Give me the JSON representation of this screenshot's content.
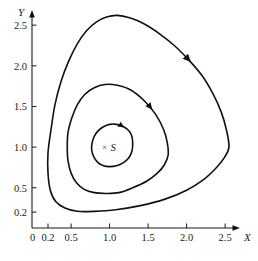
{
  "figure": {
    "kind": "phase-portrait",
    "background_color": "#ffffff",
    "curve_color": "#111111",
    "axis_color": "#1a1a1a"
  },
  "axes": {
    "x_name": "X",
    "y_name": "Y",
    "x_ticks": [
      "0",
      "0.2",
      "0.5",
      "1.0",
      "1.5",
      "2.0",
      "2.5"
    ],
    "x_tick_values": [
      0,
      0.2,
      0.5,
      1.0,
      1.5,
      2.0,
      2.5
    ],
    "y_ticks": [
      "0.2",
      "0.5",
      "1.0",
      "1.5",
      "2.0",
      "2.5"
    ],
    "y_tick_values": [
      0.2,
      0.5,
      1.0,
      1.5,
      2.0,
      2.5
    ],
    "x_range": [
      0,
      2.75
    ],
    "y_range": [
      0,
      2.75
    ],
    "grid": false
  },
  "annotations": {
    "fixed_point_marker": "×",
    "fixed_point_label": "S",
    "fixed_point_x": 1.0,
    "fixed_point_y": 1.0
  },
  "chart_data": {
    "type": "line",
    "title": "",
    "subtitle": "",
    "xlabel": "X",
    "ylabel": "Y",
    "xlim": [
      0,
      2.75
    ],
    "ylim": [
      0,
      2.75
    ],
    "grid": false,
    "legend": "none",
    "annotations": [
      {
        "text": "×S",
        "x": 1.0,
        "y": 1.0,
        "role": "fixed-point"
      }
    ],
    "series": [
      {
        "name": "orbit-inner",
        "closed": true,
        "direction": "counterclockwise",
        "x_min": 0.77,
        "x_max": 1.3,
        "y_min": 0.76,
        "y_max": 1.28,
        "arrow_at": {
          "x": 1.19,
          "y": 1.24
        },
        "points": [
          [
            1.3,
            1.04
          ],
          [
            1.29,
            1.13
          ],
          [
            1.25,
            1.2
          ],
          [
            1.18,
            1.25
          ],
          [
            1.09,
            1.28
          ],
          [
            1.0,
            1.28
          ],
          [
            0.92,
            1.25
          ],
          [
            0.85,
            1.2
          ],
          [
            0.8,
            1.13
          ],
          [
            0.77,
            1.04
          ],
          [
            0.77,
            0.95
          ],
          [
            0.8,
            0.87
          ],
          [
            0.85,
            0.81
          ],
          [
            0.92,
            0.77
          ],
          [
            1.0,
            0.76
          ],
          [
            1.09,
            0.77
          ],
          [
            1.18,
            0.81
          ],
          [
            1.25,
            0.87
          ],
          [
            1.29,
            0.95
          ],
          [
            1.3,
            1.04
          ]
        ]
      },
      {
        "name": "orbit-middle",
        "closed": true,
        "direction": "counterclockwise",
        "x_min": 0.45,
        "x_max": 1.76,
        "y_min": 0.43,
        "y_max": 1.77,
        "arrow_at": {
          "x": 1.58,
          "y": 1.48
        },
        "points": [
          [
            1.76,
            0.9
          ],
          [
            1.75,
            1.05
          ],
          [
            1.7,
            1.22
          ],
          [
            1.6,
            1.4
          ],
          [
            1.45,
            1.57
          ],
          [
            1.28,
            1.7
          ],
          [
            1.1,
            1.76
          ],
          [
            0.94,
            1.77
          ],
          [
            0.8,
            1.73
          ],
          [
            0.68,
            1.65
          ],
          [
            0.58,
            1.52
          ],
          [
            0.51,
            1.36
          ],
          [
            0.46,
            1.18
          ],
          [
            0.45,
            1.0
          ],
          [
            0.46,
            0.83
          ],
          [
            0.5,
            0.68
          ],
          [
            0.57,
            0.56
          ],
          [
            0.67,
            0.48
          ],
          [
            0.8,
            0.44
          ],
          [
            0.95,
            0.43
          ],
          [
            1.12,
            0.44
          ],
          [
            1.3,
            0.5
          ],
          [
            1.48,
            0.58
          ],
          [
            1.62,
            0.68
          ],
          [
            1.71,
            0.78
          ],
          [
            1.76,
            0.9
          ]
        ]
      },
      {
        "name": "orbit-outer",
        "closed": true,
        "direction": "counterclockwise",
        "x_min": 0.2,
        "x_max": 2.55,
        "y_min": 0.21,
        "y_max": 2.62,
        "arrow_at": {
          "x": 2.04,
          "y": 2.03
        },
        "points": [
          [
            2.55,
            1.0
          ],
          [
            2.52,
            1.2
          ],
          [
            2.45,
            1.43
          ],
          [
            2.34,
            1.66
          ],
          [
            2.2,
            1.88
          ],
          [
            2.03,
            2.07
          ],
          [
            1.84,
            2.25
          ],
          [
            1.64,
            2.4
          ],
          [
            1.44,
            2.52
          ],
          [
            1.26,
            2.59
          ],
          [
            1.1,
            2.62
          ],
          [
            0.96,
            2.6
          ],
          [
            0.83,
            2.54
          ],
          [
            0.7,
            2.43
          ],
          [
            0.58,
            2.27
          ],
          [
            0.47,
            2.06
          ],
          [
            0.37,
            1.81
          ],
          [
            0.29,
            1.52
          ],
          [
            0.24,
            1.22
          ],
          [
            0.2,
            0.93
          ],
          [
            0.2,
            0.68
          ],
          [
            0.23,
            0.47
          ],
          [
            0.3,
            0.33
          ],
          [
            0.42,
            0.25
          ],
          [
            0.58,
            0.21
          ],
          [
            0.8,
            0.21
          ],
          [
            1.08,
            0.23
          ],
          [
            1.4,
            0.28
          ],
          [
            1.72,
            0.36
          ],
          [
            2.0,
            0.47
          ],
          [
            2.22,
            0.6
          ],
          [
            2.38,
            0.74
          ],
          [
            2.49,
            0.87
          ],
          [
            2.55,
            1.0
          ]
        ]
      }
    ]
  }
}
